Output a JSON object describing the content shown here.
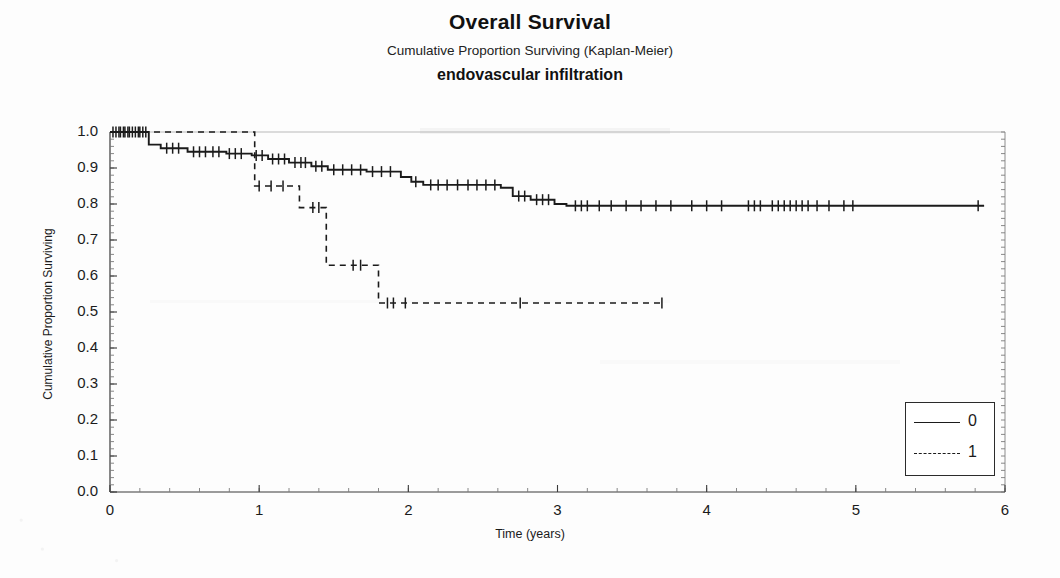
{
  "titles": {
    "main": "Overall Survival",
    "sub": "Cumulative Proportion Surviving (Kaplan-Meier)",
    "group": "endovascular infiltration"
  },
  "axes": {
    "x_title": "Time (years)",
    "y_title": "Cumulative Proportion Surviving"
  },
  "legend": {
    "entries": [
      {
        "label": "0",
        "style": "solid"
      },
      {
        "label": "1",
        "style": "dashed"
      }
    ]
  },
  "chart_data": {
    "type": "line",
    "subtype": "kaplan-meier-step",
    "title": "Overall Survival",
    "subtitle": "Cumulative Proportion Surviving (Kaplan-Meier)",
    "group_label": "endovascular infiltration",
    "xlabel": "Time (years)",
    "ylabel": "Cumulative Proportion Surviving",
    "xlim": [
      0,
      6
    ],
    "ylim": [
      0,
      1
    ],
    "xticks": [
      0,
      1,
      2,
      3,
      4,
      5,
      6
    ],
    "yticks": [
      0.0,
      0.1,
      0.2,
      0.3,
      0.4,
      0.5,
      0.6,
      0.7,
      0.8,
      0.9,
      1.0
    ],
    "grid": false,
    "legend_position": "lower right",
    "line_color": "#1b1b1b",
    "series": [
      {
        "name": "0",
        "style": "solid",
        "steps": [
          [
            0.0,
            1.0
          ],
          [
            0.26,
            1.0
          ],
          [
            0.26,
            0.965
          ],
          [
            0.34,
            0.965
          ],
          [
            0.34,
            0.955
          ],
          [
            0.52,
            0.955
          ],
          [
            0.52,
            0.945
          ],
          [
            0.78,
            0.945
          ],
          [
            0.78,
            0.94
          ],
          [
            0.95,
            0.94
          ],
          [
            0.95,
            0.935
          ],
          [
            1.06,
            0.935
          ],
          [
            1.06,
            0.925
          ],
          [
            1.2,
            0.925
          ],
          [
            1.2,
            0.915
          ],
          [
            1.35,
            0.915
          ],
          [
            1.35,
            0.905
          ],
          [
            1.46,
            0.905
          ],
          [
            1.46,
            0.895
          ],
          [
            1.72,
            0.895
          ],
          [
            1.72,
            0.89
          ],
          [
            1.95,
            0.89
          ],
          [
            1.95,
            0.875
          ],
          [
            2.02,
            0.875
          ],
          [
            2.02,
            0.862
          ],
          [
            2.1,
            0.862
          ],
          [
            2.1,
            0.853
          ],
          [
            2.62,
            0.853
          ],
          [
            2.62,
            0.845
          ],
          [
            2.7,
            0.845
          ],
          [
            2.7,
            0.822
          ],
          [
            2.82,
            0.822
          ],
          [
            2.82,
            0.812
          ],
          [
            2.98,
            0.812
          ],
          [
            2.98,
            0.8
          ],
          [
            3.06,
            0.8
          ],
          [
            3.06,
            0.795
          ],
          [
            5.86,
            0.795
          ]
        ],
        "censor_marks": [
          [
            0.02,
            1.0
          ],
          [
            0.04,
            1.0
          ],
          [
            0.06,
            1.0
          ],
          [
            0.07,
            1.0
          ],
          [
            0.09,
            1.0
          ],
          [
            0.1,
            1.0
          ],
          [
            0.12,
            1.0
          ],
          [
            0.13,
            1.0
          ],
          [
            0.15,
            1.0
          ],
          [
            0.17,
            1.0
          ],
          [
            0.19,
            1.0
          ],
          [
            0.2,
            1.0
          ],
          [
            0.22,
            1.0
          ],
          [
            0.24,
            1.0
          ],
          [
            0.38,
            0.955
          ],
          [
            0.42,
            0.955
          ],
          [
            0.46,
            0.955
          ],
          [
            0.56,
            0.945
          ],
          [
            0.6,
            0.945
          ],
          [
            0.64,
            0.945
          ],
          [
            0.69,
            0.945
          ],
          [
            0.73,
            0.945
          ],
          [
            0.8,
            0.94
          ],
          [
            0.84,
            0.94
          ],
          [
            0.88,
            0.94
          ],
          [
            0.98,
            0.935
          ],
          [
            1.02,
            0.935
          ],
          [
            1.09,
            0.925
          ],
          [
            1.13,
            0.925
          ],
          [
            1.17,
            0.925
          ],
          [
            1.24,
            0.915
          ],
          [
            1.28,
            0.915
          ],
          [
            1.31,
            0.915
          ],
          [
            1.38,
            0.905
          ],
          [
            1.42,
            0.905
          ],
          [
            1.5,
            0.895
          ],
          [
            1.56,
            0.895
          ],
          [
            1.62,
            0.895
          ],
          [
            1.68,
            0.895
          ],
          [
            1.76,
            0.89
          ],
          [
            1.82,
            0.89
          ],
          [
            1.88,
            0.89
          ],
          [
            2.05,
            0.862
          ],
          [
            2.15,
            0.853
          ],
          [
            2.2,
            0.853
          ],
          [
            2.26,
            0.853
          ],
          [
            2.33,
            0.853
          ],
          [
            2.4,
            0.853
          ],
          [
            2.46,
            0.853
          ],
          [
            2.52,
            0.853
          ],
          [
            2.58,
            0.853
          ],
          [
            2.74,
            0.822
          ],
          [
            2.78,
            0.822
          ],
          [
            2.86,
            0.812
          ],
          [
            2.9,
            0.812
          ],
          [
            2.94,
            0.812
          ],
          [
            3.12,
            0.795
          ],
          [
            3.16,
            0.795
          ],
          [
            3.2,
            0.795
          ],
          [
            3.28,
            0.795
          ],
          [
            3.36,
            0.795
          ],
          [
            3.46,
            0.795
          ],
          [
            3.56,
            0.795
          ],
          [
            3.66,
            0.795
          ],
          [
            3.76,
            0.795
          ],
          [
            3.9,
            0.795
          ],
          [
            4.0,
            0.795
          ],
          [
            4.1,
            0.795
          ],
          [
            4.28,
            0.795
          ],
          [
            4.32,
            0.795
          ],
          [
            4.36,
            0.795
          ],
          [
            4.44,
            0.795
          ],
          [
            4.48,
            0.795
          ],
          [
            4.52,
            0.795
          ],
          [
            4.56,
            0.795
          ],
          [
            4.6,
            0.795
          ],
          [
            4.64,
            0.795
          ],
          [
            4.68,
            0.795
          ],
          [
            4.74,
            0.795
          ],
          [
            4.82,
            0.795
          ],
          [
            4.92,
            0.795
          ],
          [
            4.98,
            0.795
          ],
          [
            5.82,
            0.795
          ]
        ]
      },
      {
        "name": "1",
        "style": "dashed",
        "steps": [
          [
            0.0,
            1.0
          ],
          [
            0.97,
            1.0
          ],
          [
            0.97,
            0.85
          ],
          [
            1.27,
            0.85
          ],
          [
            1.27,
            0.79
          ],
          [
            1.45,
            0.79
          ],
          [
            1.45,
            0.63
          ],
          [
            1.8,
            0.63
          ],
          [
            1.8,
            0.525
          ],
          [
            3.72,
            0.525
          ]
        ],
        "censor_marks": [
          [
            1.0,
            0.85
          ],
          [
            1.08,
            0.85
          ],
          [
            1.16,
            0.85
          ],
          [
            1.36,
            0.79
          ],
          [
            1.4,
            0.79
          ],
          [
            1.63,
            0.63
          ],
          [
            1.68,
            0.63
          ],
          [
            1.86,
            0.525
          ],
          [
            1.9,
            0.525
          ],
          [
            1.98,
            0.525
          ],
          [
            2.75,
            0.525
          ],
          [
            3.7,
            0.525
          ]
        ]
      }
    ]
  }
}
